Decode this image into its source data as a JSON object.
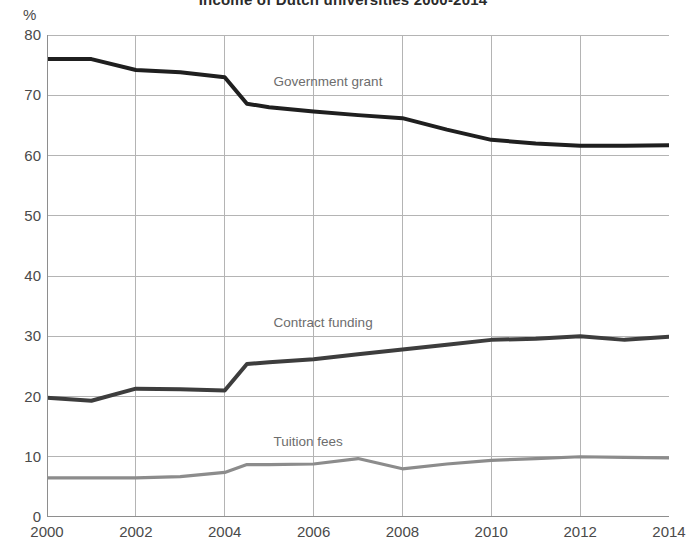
{
  "chart_data": {
    "type": "line",
    "title": "Income of Dutch universities 2000-2014",
    "subtitle": "",
    "xlabel": "",
    "ylabel": "%",
    "unit_label": "%",
    "xlim": [
      2000,
      2014
    ],
    "ylim": [
      0,
      80
    ],
    "grid": true,
    "legend_position": "inline-annotations",
    "y_ticks": [
      80,
      70,
      60,
      50,
      40,
      30,
      20,
      10,
      0
    ],
    "x_ticks": [
      2000,
      2002,
      2004,
      2006,
      2008,
      2010,
      2012,
      2014
    ],
    "x": [
      2000,
      2001,
      2002,
      2003,
      2004,
      2004.5,
      2005,
      2006,
      2007,
      2008,
      2009,
      2010,
      2011,
      2012,
      2013,
      2014
    ],
    "series": [
      {
        "name": "Government grant",
        "color": "#1f1f1f",
        "annotation": "Government grant",
        "annotation_x": 2005.1,
        "annotation_y": 72.2,
        "values": [
          76.0,
          76.0,
          74.2,
          73.8,
          73.0,
          68.6,
          68.0,
          67.3,
          66.7,
          66.2,
          64.3,
          62.6,
          62.0,
          61.6,
          61.6,
          61.7
        ]
      },
      {
        "name": "Contract funding",
        "color": "#3d3d3d",
        "annotation": "Contract funding",
        "annotation_x": 2005.1,
        "annotation_y": 32.2,
        "values": [
          19.8,
          19.3,
          21.3,
          21.2,
          21.0,
          25.4,
          25.7,
          26.2,
          27.0,
          27.8,
          28.6,
          29.4,
          29.6,
          30.0,
          29.4,
          29.9
        ]
      },
      {
        "name": "Tuition fees",
        "color": "#8c8c8c",
        "annotation": "Tuition fees",
        "annotation_x": 2005.1,
        "annotation_y": 12.4,
        "values": [
          6.5,
          6.5,
          6.5,
          6.7,
          7.4,
          8.7,
          8.7,
          8.8,
          9.7,
          8.0,
          8.8,
          9.4,
          9.7,
          10.0,
          9.9,
          9.8
        ]
      }
    ]
  },
  "style": {
    "axis_color": "#8e8e8e",
    "grid_color": "#b4b4b4",
    "text_color": "#4a4a4a",
    "annotation_color": "#6d6d6d",
    "background": "#ffffff"
  }
}
